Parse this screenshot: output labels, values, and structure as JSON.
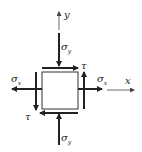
{
  "diagram": {
    "type": "plane-stress-element",
    "colors": {
      "line": "#222222",
      "axis": "#444444",
      "background": "#ffffff"
    },
    "axes": {
      "x": {
        "label": "x"
      },
      "y": {
        "label": "y"
      }
    },
    "element": {
      "shape": "square"
    },
    "stresses": {
      "sigma_y_top": {
        "symbol": "σ",
        "subscript": "y"
      },
      "sigma_y_bottom": {
        "symbol": "σ",
        "subscript": "y"
      },
      "sigma_x_left": {
        "symbol": "σ",
        "subscript": "x"
      },
      "sigma_x_right": {
        "symbol": "σ",
        "subscript": "x"
      },
      "tau_top": {
        "symbol": "τ"
      },
      "tau_right": {
        "symbol": "τ"
      },
      "tau_left": {
        "symbol": "τ"
      },
      "tau_bottom": {
        "symbol": "τ"
      }
    }
  }
}
